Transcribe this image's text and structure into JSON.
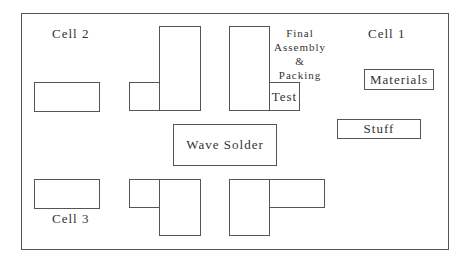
{
  "diagram": {
    "labels": {
      "cell1": "Cell 1",
      "cell2": "Cell 2",
      "cell3": "Cell 3",
      "final_assembly": [
        "Final",
        "Assembly",
        "&",
        "Packing"
      ],
      "test": "Test",
      "materials": "Materials",
      "stuff": "Stuff",
      "wave_solder": "Wave Solder"
    }
  }
}
